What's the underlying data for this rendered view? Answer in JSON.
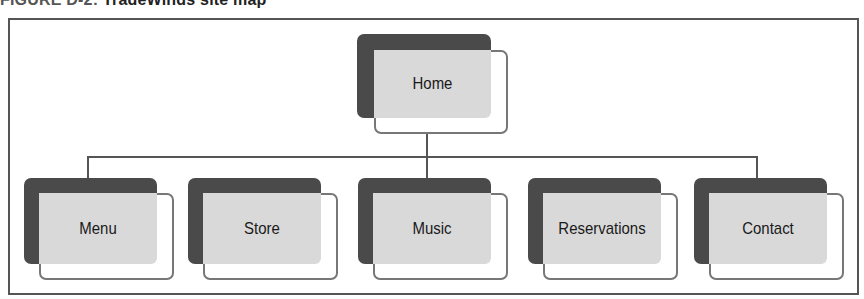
{
  "figure": {
    "number": "FIGURE D-2:",
    "title": "TradeWinds site map"
  },
  "colors": {
    "back_box": "#4a4a4a",
    "front_fill": "#d9d9d9",
    "outline": "#777777",
    "connector": "#555555"
  },
  "sitemap": {
    "root": {
      "label": "Home"
    },
    "children": [
      {
        "label": "Menu"
      },
      {
        "label": "Store"
      },
      {
        "label": "Music"
      },
      {
        "label": "Reservations"
      },
      {
        "label": "Contact"
      }
    ]
  }
}
